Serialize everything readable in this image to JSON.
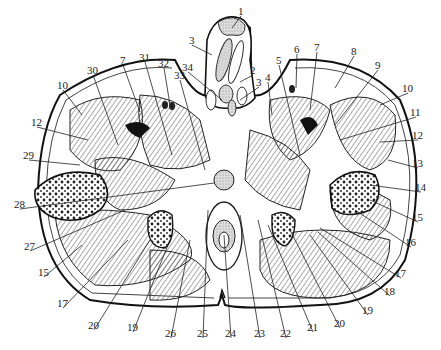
{
  "diagram": {
    "type": "anatomical-cross-section",
    "labels": [
      {
        "id": "1",
        "text": "1",
        "x": 238,
        "y": 6,
        "tx": 232,
        "ty": 28
      },
      {
        "id": "2",
        "text": "2",
        "x": 250,
        "y": 65,
        "tx": 240,
        "ty": 82
      },
      {
        "id": "3a",
        "text": "3",
        "x": 189,
        "y": 35,
        "tx": 212,
        "ty": 55
      },
      {
        "id": "3b",
        "text": "3",
        "x": 256,
        "y": 77,
        "tx": 240,
        "ty": 100
      },
      {
        "id": "4",
        "text": "4",
        "x": 265,
        "y": 72,
        "tx": 272,
        "ty": 115
      },
      {
        "id": "5",
        "text": "5",
        "x": 276,
        "y": 55,
        "tx": 300,
        "ty": 155
      },
      {
        "id": "6",
        "text": "6",
        "x": 294,
        "y": 44,
        "tx": 296,
        "ty": 88
      },
      {
        "id": "7a",
        "text": "7",
        "x": 120,
        "y": 55,
        "tx": 140,
        "ty": 112
      },
      {
        "id": "7b",
        "text": "7",
        "x": 314,
        "y": 42,
        "tx": 310,
        "ty": 110
      },
      {
        "id": "8",
        "text": "8",
        "x": 351,
        "y": 46,
        "tx": 335,
        "ty": 88
      },
      {
        "id": "9",
        "text": "9",
        "x": 375,
        "y": 60,
        "tx": 335,
        "ty": 125
      },
      {
        "id": "10a",
        "text": "10",
        "x": 57,
        "y": 80,
        "tx": 82,
        "ty": 115
      },
      {
        "id": "10b",
        "text": "10",
        "x": 402,
        "y": 83,
        "tx": 380,
        "ty": 105
      },
      {
        "id": "11",
        "text": "11",
        "x": 410,
        "y": 107,
        "tx": 340,
        "ty": 140
      },
      {
        "id": "12a",
        "text": "12",
        "x": 31,
        "y": 117,
        "tx": 88,
        "ty": 140
      },
      {
        "id": "12b",
        "text": "12",
        "x": 412,
        "y": 130,
        "tx": 380,
        "ty": 142
      },
      {
        "id": "13",
        "text": "13",
        "x": 412,
        "y": 158,
        "tx": 388,
        "ty": 160
      },
      {
        "id": "14",
        "text": "14",
        "x": 415,
        "y": 182,
        "tx": 370,
        "ty": 185
      },
      {
        "id": "15a",
        "text": "15",
        "x": 38,
        "y": 267,
        "tx": 82,
        "ty": 245
      },
      {
        "id": "15b",
        "text": "15",
        "x": 412,
        "y": 212,
        "tx": 370,
        "ty": 200
      },
      {
        "id": "16",
        "text": "16",
        "x": 405,
        "y": 237,
        "tx": 355,
        "ty": 210
      },
      {
        "id": "17a",
        "text": "17",
        "x": 57,
        "y": 298,
        "tx": 128,
        "ty": 240
      },
      {
        "id": "17b",
        "text": "17",
        "x": 395,
        "y": 268,
        "tx": 320,
        "ty": 228
      },
      {
        "id": "18",
        "text": "18",
        "x": 384,
        "y": 286,
        "tx": 318,
        "ty": 232
      },
      {
        "id": "19a",
        "text": "19",
        "x": 127,
        "y": 322,
        "tx": 168,
        "ty": 245
      },
      {
        "id": "19b",
        "text": "19",
        "x": 362,
        "y": 305,
        "tx": 310,
        "ty": 235
      },
      {
        "id": "20a",
        "text": "20",
        "x": 88,
        "y": 320,
        "tx": 150,
        "ty": 240
      },
      {
        "id": "20b",
        "text": "20",
        "x": 334,
        "y": 318,
        "tx": 290,
        "ty": 230
      },
      {
        "id": "21",
        "text": "21",
        "x": 307,
        "y": 322,
        "tx": 268,
        "ty": 225
      },
      {
        "id": "22",
        "text": "22",
        "x": 280,
        "y": 328,
        "tx": 258,
        "ty": 220
      },
      {
        "id": "23",
        "text": "23",
        "x": 254,
        "y": 328,
        "tx": 240,
        "ty": 215
      },
      {
        "id": "24",
        "text": "24",
        "x": 225,
        "y": 328,
        "tx": 224,
        "ty": 235
      },
      {
        "id": "25",
        "text": "25",
        "x": 197,
        "y": 328,
        "tx": 208,
        "ty": 210
      },
      {
        "id": "26",
        "text": "26",
        "x": 165,
        "y": 328,
        "tx": 190,
        "ty": 240
      },
      {
        "id": "27",
        "text": "27",
        "x": 24,
        "y": 241,
        "tx": 125,
        "ty": 210
      },
      {
        "id": "28",
        "text": "28",
        "x": 14,
        "y": 199,
        "tx": 214,
        "ty": 183
      },
      {
        "id": "29",
        "text": "29",
        "x": 23,
        "y": 150,
        "tx": 80,
        "ty": 165
      },
      {
        "id": "30",
        "text": "30",
        "x": 87,
        "y": 65,
        "tx": 118,
        "ty": 145
      },
      {
        "id": "31",
        "text": "31",
        "x": 139,
        "y": 52,
        "tx": 172,
        "ty": 155
      },
      {
        "id": "32",
        "text": "32",
        "x": 158,
        "y": 58,
        "tx": 170,
        "ty": 105
      },
      {
        "id": "33",
        "text": "33",
        "x": 174,
        "y": 70,
        "tx": 205,
        "ty": 170
      },
      {
        "id": "34",
        "text": "34",
        "x": 182,
        "y": 62,
        "tx": 222,
        "ty": 100
      }
    ]
  }
}
